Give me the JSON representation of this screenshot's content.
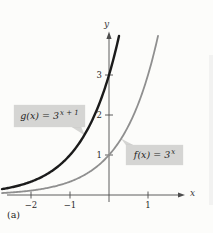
{
  "figure": {
    "subfigure_label": "(a)",
    "callouts": {
      "g": {
        "func": "g(x)",
        "eq": "=",
        "base": "3",
        "sup": "x + 1"
      },
      "f": {
        "func": "f(x)",
        "eq": "=",
        "base": "3",
        "sup": "x"
      }
    }
  },
  "colors": {
    "curve_g": "#1b1b1b",
    "curve_f": "#8f8f8f",
    "axis": "#4d4d4d",
    "text": "#2a2a2a",
    "callout_bg": "#d5d5d3",
    "page_bg": "#fcfcfa"
  },
  "chart_data": {
    "type": "line",
    "title": "",
    "xlabel": "x",
    "ylabel": "y",
    "xlim": [
      -2.75,
      2.1
    ],
    "ylim": [
      0,
      4.2
    ],
    "grid": false,
    "legend_position": "callout-boxes-on-curves",
    "x_ticks": [
      {
        "value": -2,
        "label": "−2"
      },
      {
        "value": -1,
        "label": "−1"
      },
      {
        "value": 1,
        "label": "1"
      }
    ],
    "y_ticks": [
      {
        "value": 1,
        "label": "1"
      },
      {
        "value": 2,
        "label": "2"
      },
      {
        "value": 3,
        "label": "3"
      }
    ],
    "series": [
      {
        "name": "g(x) = 3^(x+1)",
        "formula": "y = 3^(x+1)",
        "base": 3,
        "x_shift": 1,
        "color_key": "curve_g",
        "stroke_width": 2.4,
        "points": [
          [
            -2,
            0.33
          ],
          [
            -1,
            1
          ],
          [
            0,
            3
          ],
          [
            0.26,
            4
          ]
        ]
      },
      {
        "name": "f(x) = 3^x",
        "formula": "y = 3^x",
        "base": 3,
        "x_shift": 0,
        "color_key": "curve_f",
        "stroke_width": 1.8,
        "points": [
          [
            -2,
            0.11
          ],
          [
            -1,
            0.33
          ],
          [
            0,
            1
          ],
          [
            1,
            3
          ],
          [
            1.26,
            4
          ]
        ]
      }
    ]
  }
}
